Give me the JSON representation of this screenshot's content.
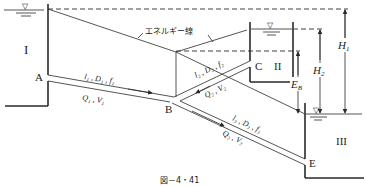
{
  "figure": {
    "caption": "図－4・41",
    "type": "three-reservoir pipe network with junction"
  },
  "reservoirs": [
    {
      "id": "I",
      "label": "I",
      "water_symbol": "▽"
    },
    {
      "id": "II",
      "label": "II",
      "water_symbol": "▽"
    },
    {
      "id": "III",
      "label": "III",
      "water_symbol": "▽"
    }
  ],
  "points": {
    "A": "A",
    "B": "B",
    "C": "C",
    "E": "E"
  },
  "energy_line": {
    "label": "エネルギー線"
  },
  "pipes": [
    {
      "id": "1",
      "props": "l₁ , D₁ , f₁",
      "flow": "Q₁ , V₁"
    },
    {
      "id": "2",
      "props": "l₂ , D₂ , f₂",
      "flow": "Q₂ , V₂"
    },
    {
      "id": "3",
      "props": "l₃ , D₃ , f₃",
      "flow": "Q₃ , V₃"
    }
  ],
  "heads": {
    "H1": "H",
    "H1_sub": "1",
    "H2": "H",
    "H2_sub": "2",
    "EB": "E",
    "EB_sub": "B"
  }
}
